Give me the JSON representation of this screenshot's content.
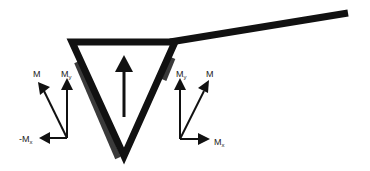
{
  "diagram": {
    "colors": {
      "stroke": "#111111",
      "shadow": "#3a3a3a",
      "background": "#ffffff"
    },
    "beam": {
      "description": "inclined line extending from triangle top-right corner"
    },
    "triangle": {
      "description": "inverted triangle with internal upward arrow"
    },
    "left_vectors": {
      "resultant": {
        "label": "M"
      },
      "vertical": {
        "label": "M",
        "subscript": "y"
      },
      "horizontal": {
        "label": "-M",
        "subscript": "x"
      }
    },
    "right_vectors": {
      "vertical": {
        "label": "M",
        "subscript": "y"
      },
      "resultant": {
        "label": "M"
      },
      "horizontal": {
        "label": "M",
        "subscript": "x"
      }
    }
  }
}
